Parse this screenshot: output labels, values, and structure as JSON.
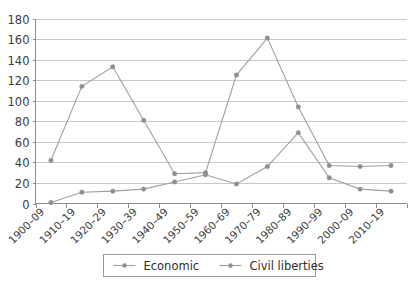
{
  "chart_data": {
    "type": "line",
    "title": "",
    "subtitle": "",
    "xlabel": "",
    "ylabel": "",
    "ylim": [
      0,
      180
    ],
    "ytick_step": 20,
    "yticks": [
      0,
      20,
      40,
      60,
      80,
      100,
      120,
      140,
      160,
      180
    ],
    "grid": true,
    "grid_axis": "y",
    "legend_position": "bottom",
    "categories": [
      "1900–09",
      "1910–19",
      "1920–29",
      "1930–39",
      "1940–49",
      "1950–59",
      "1960–69",
      "1970–79",
      "1980–89",
      "1990–99",
      "2000–09",
      "2010–19"
    ],
    "series": [
      {
        "name": "Economic",
        "color": "#9a9a9a",
        "marker": "circle",
        "values": [
          42,
          114,
          133,
          81,
          29,
          30,
          125,
          161,
          94,
          37,
          36,
          37
        ]
      },
      {
        "name": "Civil liberties",
        "color": "#9a9a9a",
        "marker": "circle",
        "values": [
          1,
          11,
          12,
          14,
          21,
          28,
          19,
          36,
          69,
          25,
          14,
          12
        ]
      }
    ]
  },
  "legend": {
    "entries": [
      {
        "label": "Economic"
      },
      {
        "label": "Civil liberties"
      }
    ]
  },
  "colors": {
    "line": "#a0a0a0",
    "marker": "#8f8f8f",
    "gridline": "#c9c9c9",
    "axis": "#8d8d8d",
    "text": "#3d3d3d",
    "background": "#ffffff"
  }
}
